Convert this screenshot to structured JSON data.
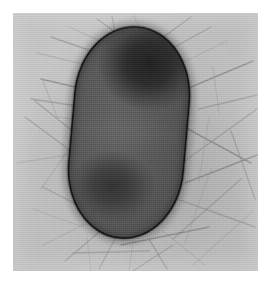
{
  "image": {
    "kind": "transmission-electron-micrograph",
    "subject": "bacterial cell with peritrichous fimbriae",
    "caption": "",
    "width_px": 274,
    "height_px": 291,
    "page_background_color": "#ffffff",
    "plate": {
      "left_px": 13,
      "top_px": 13,
      "width_px": 245,
      "height_px": 258,
      "background_color": "#c2c2c2",
      "note": "negative-stain field, light gray background"
    }
  },
  "specimen": {
    "label": "bacterium",
    "shape": "ovoid rod (capsule)",
    "orientation_degrees": 5,
    "bounds_px": {
      "left": 71,
      "top": 26,
      "width": 116,
      "height": 213
    },
    "envelope_color": "#141414",
    "cytoplasm_color": "#585858",
    "features": [
      {
        "name": "polar-dense-body",
        "position": "upper pole",
        "color": "#232323",
        "description": "large electron-dense region occupying the upper third of the cell"
      },
      {
        "name": "secondary-dense-body",
        "position": "lower third",
        "color": "#343434",
        "description": "smaller, more diffuse electron-dense region"
      },
      {
        "name": "mid-cell-light-band",
        "position": "mid-cell",
        "color": "#6e6e6e",
        "description": "faint lighter transverse band across the centre of the cell"
      }
    ]
  },
  "appendages": {
    "name": "fimbriae-flagella",
    "arrangement": "peritrichous",
    "color": "#8b8b8b",
    "approximate_count": 34,
    "description": "numerous fine filaments radiating from the cell in all directions, overlapping and crossing on the support film"
  },
  "palette": {
    "page_white": "#ffffff",
    "field_light_gray": "#c6c6c6",
    "field_mid_gray": "#b4b4b4",
    "cytoplasm_gray": "#585858",
    "dense_body_black": "#232323",
    "envelope_black": "#141414",
    "filament_gray": "#8b8b8b"
  },
  "overlays": {
    "scale_bar_text": "",
    "annotation_text": ""
  }
}
